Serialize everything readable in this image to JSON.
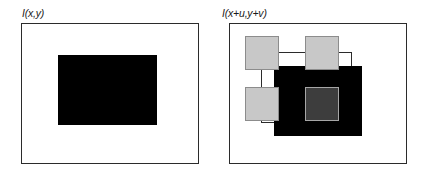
{
  "figure": {
    "background_color": "#ffffff",
    "width": 428,
    "height": 176
  },
  "panels": [
    {
      "id": "left",
      "label": "I(x,y)",
      "label_pos": {
        "x": 22,
        "y": 8
      },
      "frame": {
        "x": 21,
        "y": 23,
        "w": 178,
        "h": 141,
        "stroke": "#2b2b2b",
        "fill": "#ffffff"
      },
      "shapes": [
        {
          "name": "template-patch-black",
          "kind": "filled-rect",
          "x": 58,
          "y": 55,
          "w": 99,
          "h": 70,
          "fill": "#000000"
        }
      ]
    },
    {
      "id": "right",
      "label": "I(x+u,y+v)",
      "label_pos": {
        "x": 222,
        "y": 8
      },
      "frame": {
        "x": 229,
        "y": 23,
        "w": 178,
        "h": 141,
        "stroke": "#2b2b2b",
        "fill": "#ffffff"
      },
      "shapes": [
        {
          "name": "search-window-outline",
          "kind": "outline-rect",
          "x": 261,
          "y": 52,
          "w": 91,
          "h": 71,
          "stroke": "#2b2b2b"
        },
        {
          "name": "displaced-patch-black",
          "kind": "filled-rect",
          "x": 274,
          "y": 66,
          "w": 88,
          "h": 70,
          "fill": "#000000"
        },
        {
          "name": "candidate-square-top-left",
          "kind": "filled-square",
          "x": 245,
          "y": 36,
          "w": 34,
          "h": 34,
          "fill": "#c8c8c8",
          "stroke": "#8c8c8c"
        },
        {
          "name": "candidate-square-top-middle",
          "kind": "filled-square",
          "x": 305,
          "y": 36,
          "w": 34,
          "h": 34,
          "fill": "#c8c8c8",
          "stroke": "#8c8c8c"
        },
        {
          "name": "candidate-square-bottom-left",
          "kind": "filled-square",
          "x": 245,
          "y": 87,
          "w": 34,
          "h": 34,
          "fill": "#c8c8c8",
          "stroke": "#8c8c8c"
        },
        {
          "name": "candidate-square-center-dark",
          "kind": "filled-square",
          "x": 305,
          "y": 87,
          "w": 34,
          "h": 34,
          "fill": "#3d3d3d",
          "stroke": "#a6a6a6"
        }
      ]
    }
  ],
  "colors": {
    "black": "#000000",
    "frame_stroke": "#2b2b2b",
    "light_gray_fill": "#c8c8c8",
    "light_gray_stroke": "#8c8c8c",
    "dark_gray_fill": "#3d3d3d",
    "dark_gray_stroke": "#a6a6a6",
    "background": "#ffffff"
  }
}
